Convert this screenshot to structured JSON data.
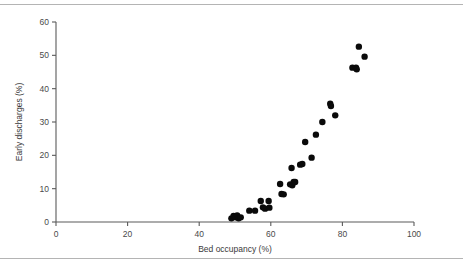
{
  "figure": {
    "frame_color": "#b4b4b4",
    "background": "#ffffff"
  },
  "chart_data": {
    "type": "scatter",
    "title": "",
    "subtitle": "",
    "xlabel": "Bed occupancy (%)",
    "ylabel": "Early discharges (%)",
    "xlim": [
      0,
      100
    ],
    "ylim": [
      0,
      60
    ],
    "xticks": [
      0,
      20,
      40,
      60,
      80,
      100
    ],
    "yticks": [
      0,
      10,
      20,
      30,
      40,
      50,
      60
    ],
    "xtick_labels": [
      "0",
      "20",
      "40",
      "60",
      "80",
      "100"
    ],
    "ytick_labels": [
      "0",
      "10",
      "20",
      "30",
      "40",
      "50",
      "60"
    ],
    "grid": false,
    "legend": null,
    "legend_position": "none",
    "marker": {
      "shape": "circle",
      "color": "#0a0a0a",
      "size_px": 3.2
    },
    "series": [
      {
        "name": "Hospital trusts",
        "color": "#0a0a0a",
        "points": [
          [
            49.0,
            1.1
          ],
          [
            49.6,
            1.8
          ],
          [
            50.2,
            1.4
          ],
          [
            50.6,
            2.0
          ],
          [
            51.0,
            1.1
          ],
          [
            51.6,
            1.4
          ],
          [
            54.0,
            3.4
          ],
          [
            55.6,
            3.4
          ],
          [
            57.2,
            6.3
          ],
          [
            57.8,
            4.4
          ],
          [
            58.4,
            4.0
          ],
          [
            59.4,
            6.3
          ],
          [
            59.6,
            4.3
          ],
          [
            62.6,
            11.4
          ],
          [
            63.0,
            8.4
          ],
          [
            63.6,
            8.3
          ],
          [
            65.4,
            11.3
          ],
          [
            66.0,
            11.0
          ],
          [
            66.4,
            12.0
          ],
          [
            66.8,
            12.0
          ],
          [
            65.8,
            16.2
          ],
          [
            68.2,
            17.2
          ],
          [
            68.8,
            17.4
          ],
          [
            71.4,
            19.3
          ],
          [
            69.6,
            24.0
          ],
          [
            72.6,
            26.2
          ],
          [
            74.4,
            30.0
          ],
          [
            76.6,
            35.5
          ],
          [
            76.8,
            34.8
          ],
          [
            78.0,
            32.0
          ],
          [
            82.8,
            46.3
          ],
          [
            83.8,
            46.3
          ],
          [
            84.0,
            45.8
          ],
          [
            84.6,
            52.6
          ],
          [
            86.2,
            49.6
          ]
        ]
      }
    ]
  }
}
